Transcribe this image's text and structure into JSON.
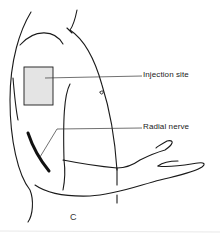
{
  "figure": {
    "panel_letter": "C",
    "labels": {
      "injection_site": "Injection site",
      "radial_nerve": "Radial nerve"
    },
    "colors": {
      "line": "#1a1a1a",
      "injection_fill": "#e4e4e4",
      "background": "#ffffff"
    }
  }
}
